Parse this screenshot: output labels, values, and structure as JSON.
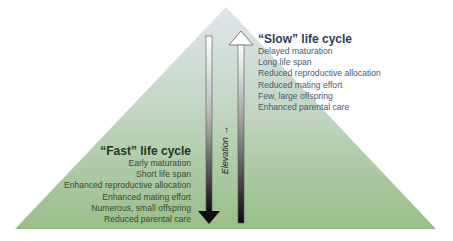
{
  "diagram": {
    "shape": "pyramid",
    "colors": {
      "top": "#dde5e8",
      "bottom": "#9cc08c",
      "down_arrow": "#111111",
      "up_arrow_top": "#ffffff",
      "up_arrow_bottom": "#111111"
    },
    "axis_label": "Elevation",
    "axis_arrow": "→",
    "slow": {
      "heading": "“Slow” life cycle",
      "items": [
        "Delayed maturation",
        "Long life span",
        "Reduced reproductive allocation",
        "Reduced mating effort",
        "Few, large offspring",
        "Enhanced parental care"
      ]
    },
    "fast": {
      "heading": "“Fast” life cycle",
      "items": [
        "Early maturation",
        "Short life span",
        "Enhanced reproductive allocation",
        "Enhanced mating effort",
        "Numerous, small offspring",
        "Reduced parental care"
      ]
    }
  }
}
